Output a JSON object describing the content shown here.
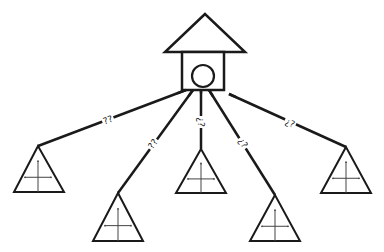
{
  "diagram": {
    "type": "hub-and-spoke",
    "stroke_color": "#1a1a1a",
    "background": "#ffffff",
    "hub": {
      "name": "house",
      "roof": {
        "apex": [
          205,
          14
        ],
        "left": [
          165,
          52
        ],
        "right": [
          245,
          52
        ]
      },
      "body": {
        "x": 182,
        "y": 52,
        "w": 42,
        "h": 38
      },
      "circle": {
        "cx": 203,
        "cy": 76,
        "r": 11
      }
    },
    "nodes": [
      {
        "id": "n1",
        "shape": "triangle-with-cross",
        "apex": [
          38,
          146
        ],
        "base_left": [
          14,
          192
        ],
        "base_right": [
          64,
          192
        ]
      },
      {
        "id": "n2",
        "shape": "triangle-with-cross",
        "apex": [
          118,
          193
        ],
        "base_left": [
          93,
          241
        ],
        "base_right": [
          143,
          241
        ]
      },
      {
        "id": "n3",
        "shape": "triangle-with-cross",
        "apex": [
          201,
          149
        ],
        "base_left": [
          176,
          193
        ],
        "base_right": [
          226,
          193
        ]
      },
      {
        "id": "n4",
        "shape": "triangle-with-cross",
        "apex": [
          275,
          195
        ],
        "base_left": [
          250,
          241
        ],
        "base_right": [
          300,
          241
        ]
      },
      {
        "id": "n5",
        "shape": "triangle-with-cross",
        "apex": [
          346,
          147
        ],
        "base_left": [
          321,
          193
        ],
        "base_right": [
          371,
          193
        ]
      }
    ],
    "edges": [
      {
        "from": [
          186,
          90
        ],
        "to": [
          38,
          146
        ],
        "label": "??",
        "label_pos": [
          108,
          120
        ]
      },
      {
        "from": [
          193,
          90
        ],
        "to": [
          118,
          193
        ],
        "label": "??",
        "label_pos": [
          153,
          144
        ]
      },
      {
        "from": [
          201,
          90
        ],
        "to": [
          201,
          149
        ],
        "label": "¿?",
        "label_pos": [
          201,
          122
        ]
      },
      {
        "from": [
          209,
          90
        ],
        "to": [
          275,
          195
        ],
        "label": "¿?",
        "label_pos": [
          243,
          143
        ]
      },
      {
        "from": [
          229,
          94
        ],
        "to": [
          346,
          147
        ],
        "label": "¿?",
        "label_pos": [
          290,
          123
        ]
      }
    ]
  }
}
